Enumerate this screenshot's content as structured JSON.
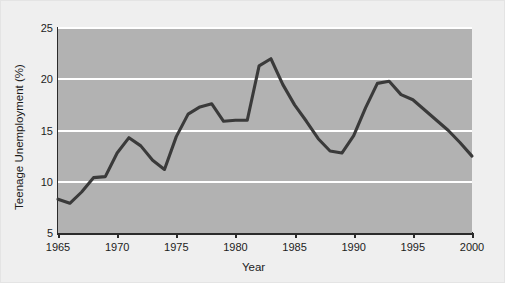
{
  "chart_data": {
    "type": "line",
    "title": "",
    "xlabel": "Year",
    "ylabel": "Teenage Unemployment (%)",
    "xlim": [
      1965,
      2000
    ],
    "ylim": [
      5,
      25
    ],
    "grid": true,
    "legend": false,
    "xticks": [
      "1965",
      "1970",
      "1975",
      "1980",
      "1985",
      "1990",
      "1995",
      "2000"
    ],
    "xtick_values": [
      1965,
      1970,
      1975,
      1980,
      1985,
      1990,
      1995,
      2000
    ],
    "yticks": [
      "5",
      "10",
      "15",
      "20",
      "25"
    ],
    "ytick_values": [
      5,
      10,
      15,
      20,
      25
    ],
    "x": [
      1965,
      1966,
      1967,
      1968,
      1969,
      1970,
      1971,
      1972,
      1973,
      1974,
      1975,
      1976,
      1977,
      1978,
      1979,
      1980,
      1981,
      1982,
      1983,
      1984,
      1985,
      1986,
      1987,
      1988,
      1989,
      1990,
      1991,
      1992,
      1993,
      1994,
      1995,
      1996,
      1997,
      1998,
      1999,
      2000
    ],
    "values": [
      8.3,
      7.9,
      9.0,
      10.4,
      10.5,
      12.8,
      14.3,
      13.5,
      12.1,
      11.2,
      14.4,
      16.6,
      17.3,
      17.6,
      15.9,
      16.0,
      16.0,
      21.3,
      22.0,
      19.5,
      17.5,
      15.9,
      14.2,
      13.0,
      12.8,
      14.5,
      17.2,
      19.6,
      19.8,
      18.5,
      18.0,
      17.0,
      16.0,
      15.0,
      13.8,
      12.5
    ],
    "series": [
      {
        "name": "Teenage Unemployment",
        "color": "#3a3a3a",
        "values": [
          8.3,
          7.9,
          9.0,
          10.4,
          10.5,
          12.8,
          14.3,
          13.5,
          12.1,
          11.2,
          14.4,
          16.6,
          17.3,
          17.6,
          15.9,
          16.0,
          16.0,
          21.3,
          22.0,
          19.5,
          17.5,
          15.9,
          14.2,
          13.0,
          12.8,
          14.5,
          17.2,
          19.6,
          19.8,
          18.5,
          18.0,
          17.0,
          16.0,
          15.0,
          13.8,
          12.5
        ]
      }
    ],
    "colors": {
      "line": "#3a3a3a",
      "plot_background": "#b2b2b2",
      "figure_background": "#efefef",
      "gridline": "#ffffff",
      "axis": "#2b2b2b",
      "text": "#1c1c1c"
    }
  }
}
